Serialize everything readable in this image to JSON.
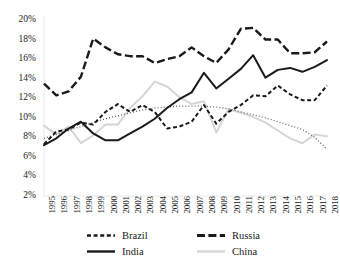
{
  "chart_data": {
    "type": "line",
    "title": "",
    "subtitle": "",
    "xlabel": "",
    "ylabel": "",
    "x": [
      1995,
      1996,
      1997,
      1998,
      1999,
      2000,
      2001,
      2002,
      2003,
      2004,
      2005,
      2006,
      2007,
      2008,
      2009,
      2010,
      2011,
      2012,
      2013,
      2014,
      2015,
      2016,
      2017,
      2018
    ],
    "xlim": [
      1995,
      2018
    ],
    "ylim": [
      2,
      20
    ],
    "yticks": [
      2,
      4,
      6,
      8,
      10,
      12,
      14,
      16,
      18,
      20
    ],
    "ytick_labels": [
      "2%",
      "4%",
      "6%",
      "8%",
      "10%",
      "12%",
      "14%",
      "16%",
      "18%",
      "20%"
    ],
    "xtick_labels": [
      "1995",
      "1996",
      "1997",
      "1998",
      "1999",
      "2000",
      "2001",
      "2002",
      "2003",
      "2004",
      "2005",
      "2006",
      "2007",
      "2008",
      "2009",
      "2010",
      "2011",
      "2012",
      "2013",
      "2014",
      "2015",
      "2016",
      "2017",
      "2018"
    ],
    "grid": false,
    "legend_position": "bottom",
    "value_unit": "percent",
    "series": [
      {
        "name": "Brazil",
        "style": "dashed",
        "color": "#1a1a1a",
        "values": [
          7.3,
          8.6,
          8.8,
          9.5,
          9.3,
          10.6,
          11.4,
          10.6,
          11.3,
          10.6,
          8.9,
          9.1,
          9.6,
          11.3,
          9.4,
          10.6,
          11.3,
          12.3,
          12.2,
          13.3,
          12.4,
          11.8,
          11.8,
          13.3
        ]
      },
      {
        "name": "Russia",
        "style": "long-dashed",
        "color": "#1a1a1a",
        "values": [
          13.5,
          12.3,
          12.7,
          14.2,
          18.1,
          17.2,
          16.5,
          16.3,
          16.3,
          15.6,
          16.0,
          16.3,
          17.2,
          16.3,
          15.6,
          17.0,
          19.1,
          19.2,
          18.0,
          18.0,
          16.6,
          16.6,
          16.7,
          17.8
        ]
      },
      {
        "name": "India",
        "style": "solid",
        "color": "#1a1a1a",
        "values": [
          7.2,
          7.9,
          8.9,
          9.6,
          8.4,
          7.7,
          7.7,
          8.4,
          9.1,
          9.9,
          11.0,
          11.9,
          12.6,
          14.6,
          13.0,
          14.0,
          15.0,
          16.4,
          14.1,
          14.9,
          15.1,
          14.7,
          15.2,
          15.9
        ]
      },
      {
        "name": "China",
        "style": "solid-light",
        "color": "#d6d6d6",
        "values": [
          9.2,
          8.3,
          9.1,
          7.4,
          8.2,
          9.3,
          9.3,
          11.0,
          12.2,
          13.7,
          13.2,
          12.1,
          11.4,
          11.7,
          8.5,
          10.9,
          10.5,
          10.1,
          9.5,
          8.7,
          7.9,
          7.4,
          8.3,
          8.1
        ]
      },
      {
        "name": "trendline",
        "style": "dotted",
        "color": "#555555",
        "values": [
          7.9,
          8.3,
          8.7,
          9.1,
          9.5,
          9.9,
          10.2,
          10.5,
          10.8,
          11.0,
          11.1,
          11.2,
          11.2,
          11.2,
          11.1,
          10.9,
          10.6,
          10.3,
          10.0,
          9.6,
          9.2,
          8.8,
          8.0,
          6.8
        ]
      }
    ]
  },
  "legend": {
    "items": [
      {
        "label": "Brazil",
        "key": "dashed"
      },
      {
        "label": "Russia",
        "key": "long-dashed"
      },
      {
        "label": "India",
        "key": "solid"
      },
      {
        "label": "China",
        "key": "solid-light"
      }
    ]
  },
  "colors": {
    "ink": "#1a1a1a",
    "china": "#d6d6d6",
    "trendline": "#555555",
    "background": "#ffffff"
  }
}
